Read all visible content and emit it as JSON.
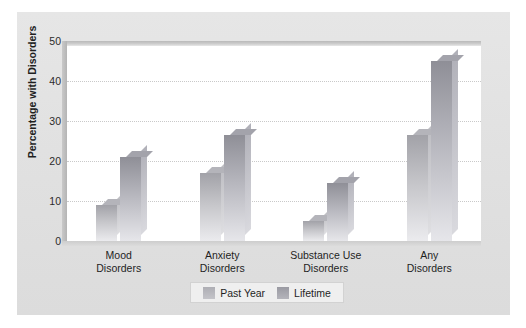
{
  "chart_data": {
    "type": "bar",
    "title": "",
    "subtitle": "",
    "xlabel": "",
    "ylabel": "Percentage with Disorders",
    "ylim": [
      0,
      50
    ],
    "yticks": [
      0,
      10,
      20,
      30,
      40,
      50
    ],
    "ytick_labels": [
      "0",
      "10",
      "20",
      "30",
      "40",
      "50"
    ],
    "grid": true,
    "grid_axis": "y",
    "legend_position": "bottom-center",
    "categories": [
      "Mood\nDisorders",
      "Anxiety\nDisorders",
      "Substance Use\nDisorders",
      "Any\nDisorders"
    ],
    "category_lines": [
      [
        "Mood",
        "Disorders"
      ],
      [
        "Anxiety",
        "Disorders"
      ],
      [
        "Substance Use",
        "Disorders"
      ],
      [
        "Any",
        "Disorders"
      ]
    ],
    "series": [
      {
        "name": "Past Year",
        "color": "#c0c0c5",
        "values": [
          9.0,
          17.0,
          5.0,
          26.5
        ]
      },
      {
        "name": "Lifetime",
        "color": "#aaaab2",
        "values": [
          21.0,
          26.5,
          14.5,
          45.0
        ]
      }
    ]
  },
  "legend": {
    "items": [
      {
        "label": "Past Year"
      },
      {
        "label": "Lifetime"
      }
    ]
  },
  "colors": {
    "panel_background": "#e2e2e2",
    "plot_background": "#ffffff",
    "gridline": "#c9c9c9",
    "text": "#1f1f1f",
    "series_past_year": "#c0c0c5",
    "series_lifetime": "#aaaab2"
  }
}
